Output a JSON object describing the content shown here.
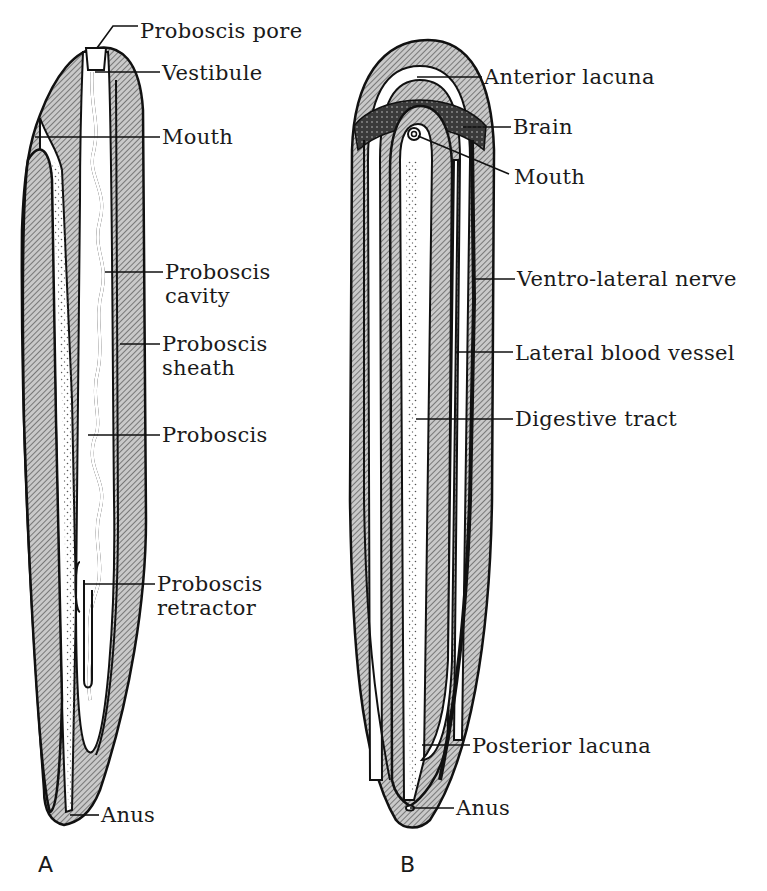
{
  "figure": {
    "panels": [
      {
        "id": "A",
        "label": "A",
        "label_pos": [
          38,
          872
        ],
        "annotations": [
          {
            "text": [
              "Proboscis pore"
            ],
            "text_pos": [
              140,
              38
            ],
            "leader": [
              [
                97,
                48
              ],
              [
                113,
                26
              ],
              [
                138,
                26
              ]
            ]
          },
          {
            "text": [
              "Vestibule"
            ],
            "text_pos": [
              162,
              80
            ],
            "leader": [
              [
                95,
                72
              ],
              [
                160,
                72
              ]
            ]
          },
          {
            "text": [
              "Mouth"
            ],
            "text_pos": [
              162,
              144
            ],
            "leader": [
              [
                35,
                137
              ],
              [
                160,
                137
              ]
            ]
          },
          {
            "text": [
              "Proboscis",
              "cavity"
            ],
            "text_pos": [
              165,
              279
            ],
            "leader": [
              [
                105,
                272
              ],
              [
                163,
                272
              ]
            ]
          },
          {
            "text": [
              "Proboscis",
              "sheath"
            ],
            "text_pos": [
              162,
              351
            ],
            "leader": [
              [
                120,
                344
              ],
              [
                160,
                344
              ]
            ]
          },
          {
            "text": [
              "Proboscis"
            ],
            "text_pos": [
              162,
              442
            ],
            "leader": [
              [
                88,
                435
              ],
              [
                160,
                435
              ]
            ]
          },
          {
            "text": [
              "Proboscis",
              "retractor"
            ],
            "text_pos": [
              157,
              591
            ],
            "leader": [
              [
                83,
                584
              ],
              [
                155,
                584
              ]
            ]
          },
          {
            "text": [
              "Anus"
            ],
            "text_pos": [
              101,
              822
            ],
            "leader": [
              [
                70,
                815
              ],
              [
                99,
                815
              ]
            ]
          }
        ]
      },
      {
        "id": "B",
        "label": "B",
        "label_pos": [
          400,
          872
        ],
        "annotations": [
          {
            "text": [
              "Anterior lacuna"
            ],
            "text_pos": [
              484,
              84
            ],
            "leader": [
              [
                417,
                77
              ],
              [
                482,
                77
              ]
            ]
          },
          {
            "text": [
              "Brain"
            ],
            "text_pos": [
              513,
              134
            ],
            "leader": [
              [
                463,
                127
              ],
              [
                511,
                127
              ]
            ]
          },
          {
            "text": [
              "Mouth"
            ],
            "text_pos": [
              514,
              184
            ],
            "leader": [
              [
                418,
                136
              ],
              [
                509,
                174
              ]
            ]
          },
          {
            "text": [
              "Ventro-lateral nerve"
            ],
            "text_pos": [
              517,
              286
            ],
            "leader": [
              [
                473,
                279
              ],
              [
                515,
                279
              ]
            ]
          },
          {
            "text": [
              "Lateral blood vessel"
            ],
            "text_pos": [
              515,
              360
            ],
            "leader": [
              [
                455,
                352
              ],
              [
                513,
                352
              ]
            ]
          },
          {
            "text": [
              "Digestive tract"
            ],
            "text_pos": [
              515,
              426
            ],
            "leader": [
              [
                416,
                419
              ],
              [
                513,
                419
              ]
            ]
          },
          {
            "text": [
              "Posterior lacuna"
            ],
            "text_pos": [
              472,
              753
            ],
            "leader": [
              [
                422,
                745
              ],
              [
                470,
                745
              ]
            ]
          },
          {
            "text": [
              "Anus"
            ],
            "text_pos": [
              456,
              815
            ],
            "leader": [
              [
                410,
                808
              ],
              [
                454,
                808
              ]
            ]
          }
        ]
      }
    ]
  }
}
